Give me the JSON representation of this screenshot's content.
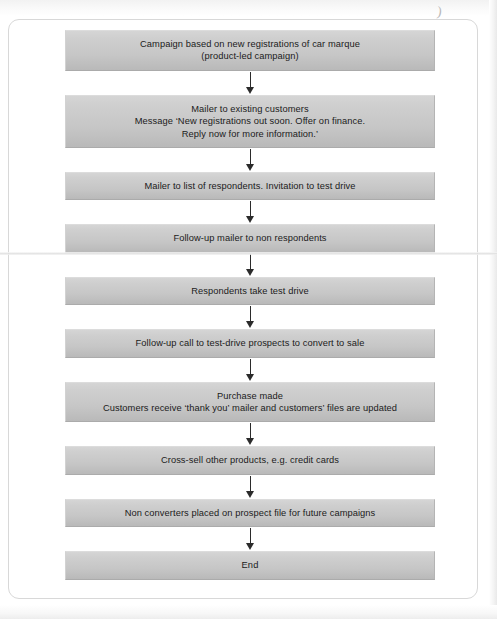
{
  "figure": {
    "orientation": "top-to-bottom",
    "connector_count": 9,
    "accent_color": "#c6c6c6",
    "frame_border_color": "#d8d8d8",
    "arrow_color": "#2b2b2b",
    "text_color": "#1b1b1b"
  },
  "artifacts": {
    "top_glyph": ")"
  },
  "nodes": [
    {
      "id": "node-campaign-basis",
      "name": "campaign-basis",
      "lines": [
        "Campaign based on new registrations of car marque",
        "(product-led campaign)"
      ]
    },
    {
      "id": "node-mailer-existing-customers",
      "name": "mailer-existing-customers",
      "lines": [
        "Mailer to existing customers",
        "Message ‘New registrations out soon. Offer on finance.",
        "Reply now for more information.’"
      ]
    },
    {
      "id": "node-mailer-respondents",
      "name": "mailer-respondents",
      "lines": [
        "Mailer to list of respondents. Invitation to test drive"
      ]
    },
    {
      "id": "node-followup-mailer",
      "name": "followup-mailer-non-respondents",
      "lines": [
        "Follow-up mailer to non respondents"
      ]
    },
    {
      "id": "node-test-drive",
      "name": "respondents-take-test-drive",
      "lines": [
        "Respondents take test drive"
      ]
    },
    {
      "id": "node-followup-call",
      "name": "followup-call-convert",
      "lines": [
        "Follow-up call to test-drive prospects to convert to sale"
      ]
    },
    {
      "id": "node-purchase-made",
      "name": "purchase-made",
      "lines": [
        "Purchase made",
        "Customers receive ‘thank you’ mailer and customers’ files are updated"
      ]
    },
    {
      "id": "node-cross-sell",
      "name": "cross-sell-products",
      "lines": [
        "Cross-sell other products, e.g. credit cards"
      ]
    },
    {
      "id": "node-non-converters",
      "name": "non-converters-prospect-file",
      "lines": [
        "Non converters placed on prospect file for future campaigns"
      ]
    },
    {
      "id": "node-end",
      "name": "end",
      "lines": [
        "End"
      ]
    }
  ]
}
